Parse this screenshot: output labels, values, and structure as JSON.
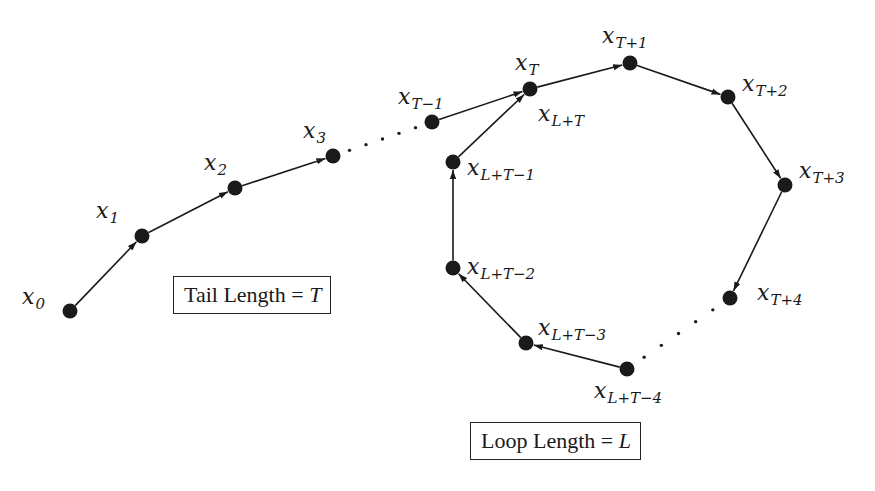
{
  "diagram": {
    "type": "rho-shaped sequence (tail and loop)",
    "colors": {
      "ink": "#1a1a1a",
      "background": "#ffffff"
    },
    "nodes": [
      {
        "id": "x0",
        "base": "x",
        "sub": "0",
        "cx": 70,
        "cy": 311,
        "lx": 22,
        "ly": 286
      },
      {
        "id": "x1",
        "base": "x",
        "sub": "1",
        "cx": 142,
        "cy": 236,
        "lx": 96,
        "ly": 200
      },
      {
        "id": "x2",
        "base": "x",
        "sub": "2",
        "cx": 235,
        "cy": 188,
        "lx": 204,
        "ly": 152
      },
      {
        "id": "x3",
        "base": "x",
        "sub": "3",
        "cx": 333,
        "cy": 156,
        "lx": 303,
        "ly": 120
      },
      {
        "id": "xT-1",
        "base": "x",
        "sub": "T−1",
        "cx": 432,
        "cy": 122,
        "lx": 398,
        "ly": 86
      },
      {
        "id": "xT",
        "base": "x",
        "sub": "T",
        "cx": 530,
        "cy": 89,
        "lx": 515,
        "ly": 52
      },
      {
        "id": "xT+1",
        "base": "x",
        "sub": "T+1",
        "cx": 630,
        "cy": 63,
        "lx": 602,
        "ly": 25
      },
      {
        "id": "xT+2",
        "base": "x",
        "sub": "T+2",
        "cx": 728,
        "cy": 97,
        "lx": 742,
        "ly": 73
      },
      {
        "id": "xT+3",
        "base": "x",
        "sub": "T+3",
        "cx": 785,
        "cy": 185,
        "lx": 799,
        "ly": 160
      },
      {
        "id": "xT+4",
        "base": "x",
        "sub": "T+4",
        "cx": 730,
        "cy": 298,
        "lx": 757,
        "ly": 282
      },
      {
        "id": "xL+T-4",
        "base": "x",
        "sub": "L+T−4",
        "cx": 627,
        "cy": 369,
        "lx": 594,
        "ly": 380
      },
      {
        "id": "xL+T-3",
        "base": "x",
        "sub": "L+T−3",
        "cx": 526,
        "cy": 343,
        "lx": 538,
        "ly": 317
      },
      {
        "id": "xL+T-2",
        "base": "x",
        "sub": "L+T−2",
        "cx": 453,
        "cy": 268,
        "lx": 467,
        "ly": 256
      },
      {
        "id": "xL+T-1",
        "base": "x",
        "sub": "L+T−1",
        "cx": 453,
        "cy": 162,
        "lx": 467,
        "ly": 157
      },
      {
        "id": "xL+T",
        "base": "x",
        "sub": "L+T",
        "cx": 530,
        "cy": 89,
        "lx": 538,
        "ly": 103,
        "label_only": true
      }
    ],
    "edges": [
      {
        "from": "x0",
        "to": "x1",
        "style": "arrow"
      },
      {
        "from": "x1",
        "to": "x2",
        "style": "arrow"
      },
      {
        "from": "x2",
        "to": "x3",
        "style": "arrow"
      },
      {
        "from": "x3",
        "to": "xT-1",
        "style": "dotted"
      },
      {
        "from": "xT-1",
        "to": "xT",
        "style": "arrow"
      },
      {
        "from": "xT",
        "to": "xT+1",
        "style": "arrow"
      },
      {
        "from": "xT+1",
        "to": "xT+2",
        "style": "arrow"
      },
      {
        "from": "xT+2",
        "to": "xT+3",
        "style": "arrow"
      },
      {
        "from": "xT+3",
        "to": "xT+4",
        "style": "arrow"
      },
      {
        "from": "xT+4",
        "to": "xL+T-4",
        "style": "dotted"
      },
      {
        "from": "xL+T-4",
        "to": "xL+T-3",
        "style": "arrow"
      },
      {
        "from": "xL+T-3",
        "to": "xL+T-2",
        "style": "arrow"
      },
      {
        "from": "xL+T-2",
        "to": "xL+T-1",
        "style": "arrow"
      },
      {
        "from": "xL+T-1",
        "to": "xT",
        "style": "arrow"
      }
    ],
    "boxes": {
      "tail": {
        "text": "Tail Length = ",
        "var": "T",
        "x": 173,
        "y": 276
      },
      "loop": {
        "text": "Loop Length = ",
        "var": "L",
        "x": 470,
        "y": 422
      }
    }
  }
}
